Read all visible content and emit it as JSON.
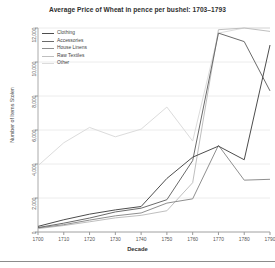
{
  "chart_data": {
    "type": "line",
    "title": "Average Price of Wheat in pence per bushel: 1703–1793",
    "xlabel": "Decade",
    "ylabel": "Number of Items Stolen",
    "grid": true,
    "legend_position": "upper-left",
    "xlim": [
      1700,
      1790
    ],
    "ylim": [
      0,
      12000
    ],
    "x": [
      1700,
      1710,
      1720,
      1730,
      1740,
      1750,
      1760,
      1770,
      1780,
      1790
    ],
    "xticks": [
      "1700",
      "1710",
      "1720",
      "1730",
      "1740",
      "1750",
      "1760",
      "1770",
      "1780",
      "1790"
    ],
    "yticks": [
      "0",
      "2,000",
      "4,000",
      "6,000",
      "8,000",
      "10,000",
      "12,000"
    ],
    "ytick_values": [
      0,
      2000,
      4000,
      6000,
      8000,
      10000,
      12000
    ],
    "series": [
      {
        "name": "Clothing",
        "color": "#4d4d4d",
        "values": [
          330,
          720,
          1050,
          1300,
          1500,
          3150,
          4400,
          5050,
          4250,
          11000
        ]
      },
      {
        "name": "Accessories",
        "color": "#6b6b6b",
        "values": [
          260,
          520,
          820,
          1180,
          1400,
          1900,
          4200,
          11700,
          11200,
          8300
        ]
      },
      {
        "name": "House Linens",
        "color": "#8f8f8f",
        "values": [
          240,
          430,
          700,
          950,
          1120,
          1700,
          1950,
          5100,
          3050,
          3100
        ]
      },
      {
        "name": "Raw Textiles",
        "color": "#bfbfbf",
        "values": [
          200,
          380,
          600,
          830,
          980,
          1250,
          2900,
          11900,
          12000,
          11800
        ]
      },
      {
        "name": "Other",
        "color": "#dcdcdc",
        "values": [
          3900,
          5250,
          6150,
          5600,
          6050,
          7350,
          5350,
          11700,
          12000,
          12000
        ]
      }
    ]
  },
  "legend": {
    "items": [
      {
        "label": "Clothing"
      },
      {
        "label": "Accessories"
      },
      {
        "label": "House Linens"
      },
      {
        "label": "Raw Textiles"
      },
      {
        "label": "Other"
      }
    ]
  }
}
